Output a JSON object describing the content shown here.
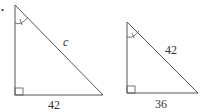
{
  "figure": {
    "bullet": "•",
    "triangles": [
      {
        "name": "left-triangle",
        "hypotenuse_label": "c",
        "base_label": "42",
        "marks": [
          "angle-arc-at-apex",
          "right-angle-square"
        ]
      },
      {
        "name": "right-triangle",
        "hypotenuse_label": "42",
        "base_label": "36",
        "marks": [
          "angle-arc-at-apex",
          "right-angle-square"
        ]
      }
    ],
    "colors": {
      "stroke": "#555555",
      "text": "#333333",
      "background": "#ffffff"
    }
  }
}
